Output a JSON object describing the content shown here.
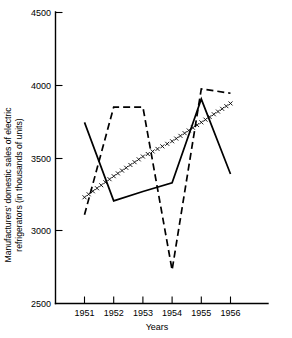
{
  "chart_data": {
    "type": "line",
    "title": "",
    "subtitle": "",
    "xlabel": "Years",
    "ylabel": "Manufacturers' domestic sales of electric refrigerators (in thousands of units)",
    "ylabel_line1": "Manufacturers' domestic sales of electric",
    "ylabel_line2": "refrigerators (in thousands of units)",
    "x": [
      1951,
      1952,
      1953,
      1954,
      1955,
      1956
    ],
    "categories": [
      "1951",
      "1952",
      "1953",
      "1954",
      "1955",
      "1956"
    ],
    "xlim": [
      1951,
      1956
    ],
    "ylim": [
      2500,
      4500
    ],
    "yticks": [
      2500,
      3000,
      3500,
      4000,
      4500
    ],
    "ytick_labels": [
      "2500",
      "3000",
      "3500",
      "4000",
      "4500"
    ],
    "xticks": [
      1951,
      1952,
      1953,
      1954,
      1955,
      1956
    ],
    "xtick_labels": [
      "1951",
      "1952",
      "1953",
      "1954",
      "1955",
      "1956"
    ],
    "grid": false,
    "legend": "none",
    "legend_position": "none",
    "series": [
      {
        "name": "solid-line",
        "style": "solid",
        "marker": "none",
        "values": [
          3745,
          3205,
          3270,
          3330,
          3905,
          3390
        ]
      },
      {
        "name": "dashed-line",
        "style": "dashed",
        "marker": "none",
        "values": [
          3110,
          3850,
          3850,
          2730,
          3975,
          3945
        ]
      },
      {
        "name": "cross-marker-line",
        "style": "dotted-x",
        "marker": "x",
        "values": [
          3230,
          3375,
          3510,
          3615,
          3745,
          3875
        ]
      }
    ],
    "annotations": []
  },
  "axis": {
    "y_tick_count": 5,
    "x_tick_count": 6
  }
}
